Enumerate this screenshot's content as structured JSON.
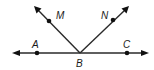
{
  "diagram": {
    "type": "geometry-angles",
    "colors": {
      "stroke": "#2a2a2a",
      "point": "#111111",
      "label": "#1a1a1a",
      "background": "#ffffff"
    },
    "points": [
      {
        "id": "A",
        "label": "A",
        "x": 37,
        "y": 53
      },
      {
        "id": "B",
        "label": "B",
        "x": 80,
        "y": 53
      },
      {
        "id": "C",
        "label": "C",
        "x": 127,
        "y": 53
      },
      {
        "id": "M",
        "label": "M",
        "x": 49,
        "y": 21
      },
      {
        "id": "N",
        "label": "N",
        "x": 113,
        "y": 20
      }
    ],
    "labels": {
      "A": "A",
      "B": "B",
      "C": "C",
      "M": "M",
      "N": "N"
    },
    "lines": [
      {
        "name": "line-AC",
        "type": "line",
        "through": [
          "A",
          "B",
          "C"
        ]
      },
      {
        "name": "ray-BM",
        "type": "ray",
        "from": "B",
        "through": "M"
      },
      {
        "name": "ray-BN",
        "type": "ray",
        "from": "B",
        "through": "N"
      }
    ]
  }
}
